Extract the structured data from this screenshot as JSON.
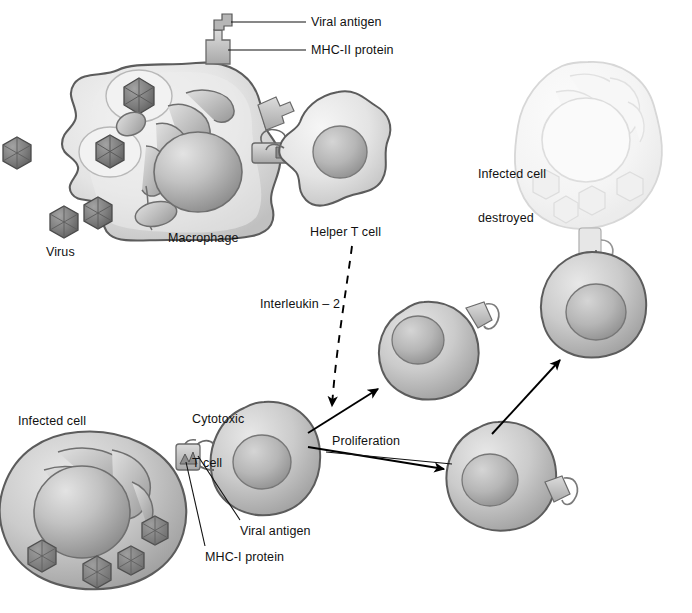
{
  "figure": {
    "type": "biology-diagram",
    "canvas": {
      "width": 692,
      "height": 613
    },
    "background_color": "#ffffff",
    "line_color": "#111111"
  },
  "labels": {
    "viral_antigen_top": "Viral antigen",
    "mhc2_protein": "MHC-II protein",
    "macrophage": "Macrophage",
    "virus": "Virus",
    "helper_t_cell": "Helper T cell",
    "interleukin_2": "Interleukin – 2",
    "infected_cell_destroyed_line1": "Infected cell",
    "infected_cell_destroyed_line2": "destroyed",
    "cytotoxic_line1": "Cytotoxic",
    "cytotoxic_line2": "T cell",
    "infected_cell": "Infected cell",
    "proliferation": "Proliferation",
    "viral_antigen_bottom": "Viral antigen",
    "mhc1_protein": "MHC-I protein"
  },
  "palette": {
    "cell_outline": "#5c5c5c",
    "cell_fill_light": "#e9e9e9",
    "cell_fill_mid": "#c9c9c9",
    "cell_fill_dark": "#a5a5a5",
    "nucleus_fill": "#b4b4b4",
    "virus_fill": "#7d7d7d",
    "virus_outline": "#4a4a4a",
    "faded_fill": "#f4f4f4",
    "faded_outline": "#d8d8d8",
    "arrow_color": "#000000"
  },
  "shapes": {
    "macrophage": {
      "cx": 180,
      "cy": 160,
      "label_x": 215,
      "label_y": 238
    },
    "helper_t_cell": {
      "cx": 338,
      "cy": 155,
      "label_x": 352,
      "label_y": 231
    },
    "infected_cell_destroyed": {
      "cx": 592,
      "cy": 145
    },
    "attacking_t_cell": {
      "cx": 592,
      "cy": 302
    },
    "proliferated_t_cell_upper": {
      "cx": 425,
      "cy": 352
    },
    "proliferated_t_cell_lower": {
      "cx": 500,
      "cy": 475
    },
    "cytotoxic_t_cell": {
      "cx": 262,
      "cy": 458
    },
    "infected_cell": {
      "cx": 85,
      "cy": 488
    },
    "free_viruses": [
      {
        "cx": 17,
        "cy": 152,
        "r": 15
      },
      {
        "cx": 64,
        "cy": 221,
        "r": 15
      },
      {
        "cx": 100,
        "cy": 205,
        "r": 15
      }
    ]
  },
  "connectors": {
    "interleukin_arrow": {
      "style": "dashed",
      "from": [
        350,
        248
      ],
      "to": [
        332,
        412
      ]
    },
    "proliferation_arrow_up": {
      "style": "solid",
      "from": [
        305,
        432
      ],
      "to": [
        382,
        386
      ]
    },
    "proliferation_arrow_down": {
      "style": "solid",
      "from": [
        305,
        447
      ],
      "to": [
        448,
        470
      ]
    },
    "kill_arrow": {
      "style": "solid",
      "from": [
        492,
        432
      ],
      "to": [
        562,
        358
      ]
    }
  }
}
